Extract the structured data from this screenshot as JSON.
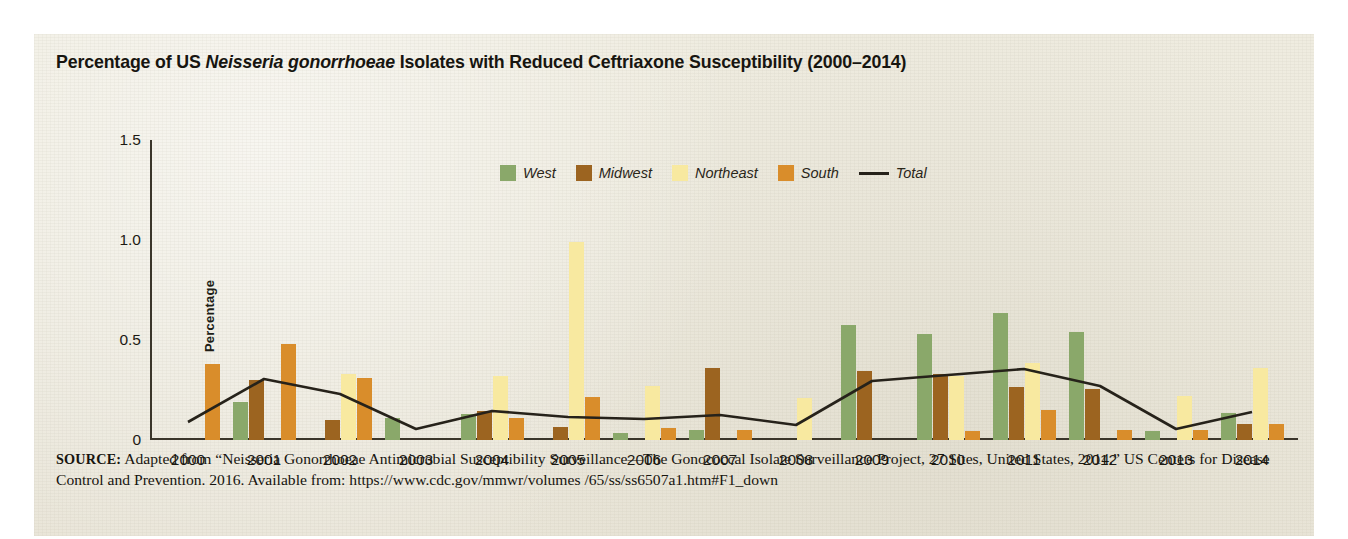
{
  "figure": {
    "title_prefix": "Percentage of US ",
    "title_italic": "Neisseria gonorrhoeae",
    "title_suffix": " Isolates with Reduced Ceftriaxone Susceptibility (2000–2014)",
    "background_color": "#edeade"
  },
  "source": {
    "label": "SOURCE:",
    "text": " Adapted from “Neisseria Gonorrhoeae Antimicrobial Susceptibility Surveillance—The Gonococcal Isolate Surveillance Project, 27 Sites, United States, 2014.” US Centers for Disease Control and Prevention. 2016. Available from: https://www.cdc.gov/mmwr/volumes /65/ss/ss6507a1.htm#F1_down"
  },
  "chart_data": {
    "type": "bar",
    "title": "Percentage of US Neisseria gonorrhoeae Isolates with Reduced Ceftriaxone Susceptibility (2000–2014)",
    "xlabel": "",
    "ylabel": "Percentage",
    "ylim": [
      0,
      1.5
    ],
    "yticks": [
      0,
      0.5,
      1.0,
      1.5
    ],
    "ytick_labels": [
      "0",
      "0.5",
      "1.0",
      "1.5"
    ],
    "grid": false,
    "legend_position": "top-center",
    "categories": [
      "2000",
      "2001",
      "2002",
      "2003",
      "2004",
      "2005",
      "2006",
      "2007",
      "2008",
      "2009",
      "2010",
      "2011",
      "2012",
      "2013",
      "2014"
    ],
    "series": [
      {
        "name": "West",
        "kind": "bar",
        "color": "#8aa86a",
        "values": [
          0,
          0.19,
          0,
          0.11,
          0.13,
          0,
          0.035,
          0.05,
          0,
          0.575,
          0.53,
          0.635,
          0.54,
          0.045,
          0.135
        ]
      },
      {
        "name": "Midwest",
        "kind": "bar",
        "color": "#9c6420",
        "values": [
          0,
          0.3,
          0.1,
          0,
          0.145,
          0.065,
          0,
          0.36,
          0,
          0.345,
          0.33,
          0.265,
          0.255,
          0,
          0.08
        ]
      },
      {
        "name": "Northeast",
        "kind": "bar",
        "color": "#f8e9a0",
        "values": [
          0,
          0,
          0.33,
          0,
          0.32,
          0.99,
          0.27,
          0,
          0.21,
          0,
          0.32,
          0.385,
          0,
          0.22,
          0.36
        ]
      },
      {
        "name": "South",
        "kind": "bar",
        "color": "#d98d2b",
        "values": [
          0.38,
          0.48,
          0.31,
          0,
          0.11,
          0.215,
          0.06,
          0.05,
          0,
          0,
          0.045,
          0.15,
          0.05,
          0.05,
          0.08
        ]
      },
      {
        "name": "Total",
        "kind": "line",
        "color": "#26221a",
        "values": [
          0.09,
          0.305,
          0.23,
          0.055,
          0.145,
          0.115,
          0.105,
          0.125,
          0.075,
          0.295,
          0.325,
          0.355,
          0.27,
          0.055,
          0.14
        ]
      }
    ]
  }
}
